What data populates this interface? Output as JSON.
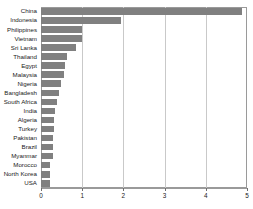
{
  "chart_data": {
    "type": "bar",
    "orientation": "horizontal",
    "title": "",
    "xlabel": "",
    "ylabel": "",
    "xlim": [
      0,
      5
    ],
    "ylim": null,
    "grid": true,
    "legend": null,
    "bar_color": "#808080",
    "frame_color": "#9a9a9a",
    "gridline_color": "#c9c9c9",
    "xticks": [
      0,
      1,
      2,
      3,
      4,
      5
    ],
    "xtick_labels": [
      "0",
      "1",
      "2",
      "3",
      "4",
      "5"
    ],
    "categories": [
      "China",
      "Indonesia",
      "Philippines",
      "Vietnam",
      "Sri Lanka",
      "Thailand",
      "Egypt",
      "Malaysia",
      "Nigeria",
      "Bangladesh",
      "South Africa",
      "India",
      "Algeria",
      "Turkey",
      "Pakistan",
      "Brazil",
      "Myanmar",
      "Morocco",
      "North Korea",
      "USA"
    ],
    "values": [
      4.88,
      1.95,
      1.0,
      1.0,
      0.85,
      0.63,
      0.58,
      0.56,
      0.49,
      0.44,
      0.39,
      0.34,
      0.32,
      0.31,
      0.3,
      0.29,
      0.28,
      0.23,
      0.22,
      0.22
    ]
  }
}
